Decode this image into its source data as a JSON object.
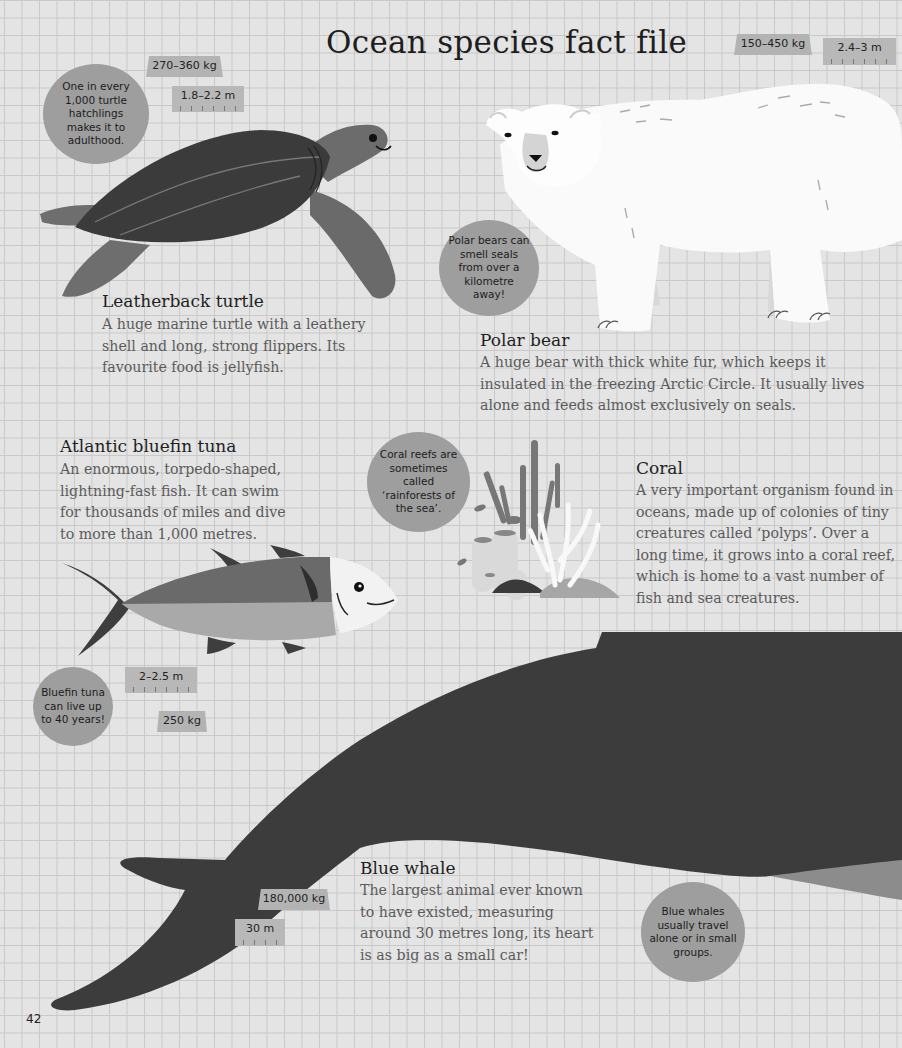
{
  "page": {
    "title": "Ocean species fact file",
    "page_number": "42",
    "colors": {
      "background": "#e4e4e4",
      "grid_line": "#c9c9c9",
      "bubble": "#9e9e9e",
      "tag": "#b3b3b3",
      "animal_dark": "#3c3c3c",
      "heading_text": "#1f1f1f",
      "body_text": "#5b5b5b"
    }
  },
  "species": {
    "turtle": {
      "name": "Leatherback turtle",
      "description": "A huge marine turtle with a leathery shell and long, strong flippers. Its favourite food is jellyfish.",
      "weight": "270–360 kg",
      "length": "1.8–2.2 m",
      "fact": "One in every 1,000 turtle hatchlings makes it to adulthood."
    },
    "polar_bear": {
      "name": "Polar bear",
      "description": "A huge bear with thick white fur, which keeps it insulated in the freezing Arctic Circle. It usually lives alone and feeds almost exclusively on seals.",
      "weight": "150–450 kg",
      "length": "2.4–3 m",
      "fact": "Polar bears can smell seals from over a kilometre away!"
    },
    "tuna": {
      "name": "Atlantic bluefin tuna",
      "description": "An enormous, torpedo-shaped, lightning-fast fish. It can swim for thousands of miles and dive to more than 1,000 metres.",
      "weight": "250 kg",
      "length": "2–2.5 m",
      "fact": "Bluefin tuna can live up to 40 years!"
    },
    "coral": {
      "name": "Coral",
      "description": "A very important organism found in oceans, made up of colonies of tiny creatures called ‘polyps’. Over a long time, it grows into a coral reef, which is home to a vast number of fish and sea creatures.",
      "fact": "Coral reefs are sometimes called ‘rainforests of the sea’."
    },
    "blue_whale": {
      "name": "Blue whale",
      "description": "The largest animal ever known to have existed, measuring around 30 metres long, its heart is as big as a small car!",
      "weight": "180,000 kg",
      "length": "30 m",
      "fact": "Blue whales usually travel alone or in small groups."
    }
  }
}
